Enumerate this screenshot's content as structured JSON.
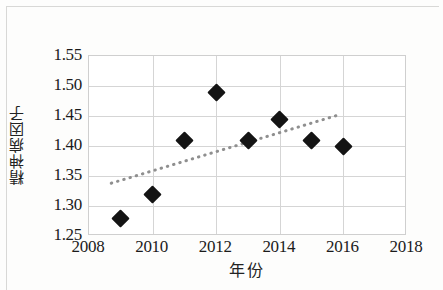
{
  "figure": {
    "kind": "scatter-with-trendline",
    "background_color": "#ffffff",
    "marker_color": "#141414",
    "trendline_color": "#8f8f8f",
    "grid_color": "#d5d5d5"
  },
  "chart_data": {
    "type": "scatter",
    "title": "",
    "xlabel": "年份",
    "ylabel": "精神病因子",
    "xlim": [
      2008,
      2018
    ],
    "ylim": [
      1.25,
      1.55
    ],
    "xticks": [
      "2008",
      "2010",
      "2012",
      "2014",
      "2016",
      "2018"
    ],
    "xtick_values": [
      2008,
      2010,
      2012,
      2014,
      2016,
      2018
    ],
    "yticks": [
      "1.25",
      "1.30",
      "1.35",
      "1.40",
      "1.45",
      "1.50",
      "1.55"
    ],
    "ytick_values": [
      1.25,
      1.3,
      1.35,
      1.4,
      1.45,
      1.5,
      1.55
    ],
    "grid": true,
    "legend": false,
    "legend_position": "none",
    "x": [
      2009,
      2010,
      2011,
      2012,
      2013,
      2014,
      2015,
      2016
    ],
    "values": [
      1.28,
      1.32,
      1.41,
      1.49,
      1.41,
      1.445,
      1.41,
      1.4
    ],
    "points": [
      {
        "x": 2009,
        "y": 1.28
      },
      {
        "x": 2010,
        "y": 1.32
      },
      {
        "x": 2011,
        "y": 1.41
      },
      {
        "x": 2012,
        "y": 1.49
      },
      {
        "x": 2013,
        "y": 1.41
      },
      {
        "x": 2014,
        "y": 1.445
      },
      {
        "x": 2015,
        "y": 1.41
      },
      {
        "x": 2016,
        "y": 1.4
      }
    ],
    "trendline": {
      "style": "dotted",
      "x_start": 2008.7,
      "y_start": 1.338,
      "x_end": 2015.8,
      "y_end": 1.451
    }
  }
}
